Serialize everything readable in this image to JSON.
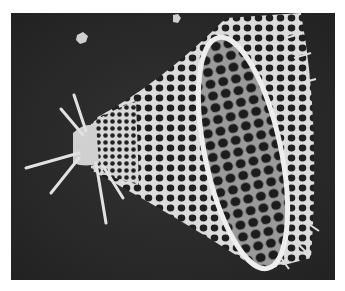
{
  "image": {
    "subject": "Radiolarian skeleton (scanning electron micrograph)",
    "style": "grayscale micrograph",
    "colors": {
      "page_background": "#ffffff",
      "photo_background": "#2a2a2a",
      "skeleton": "#e6e6e6",
      "pores": "#1e1e1e"
    }
  }
}
